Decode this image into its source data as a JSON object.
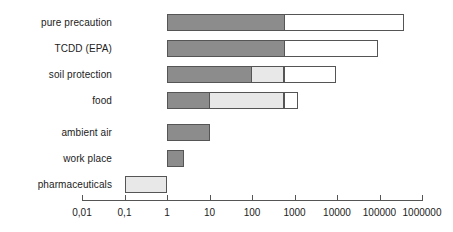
{
  "chart_data": {
    "type": "bar",
    "orientation": "horizontal",
    "title": "",
    "subtitle": "",
    "xlabel": "",
    "ylabel": "",
    "xscale": "log",
    "xlim": [
      0.01,
      1000000
    ],
    "grid": false,
    "legend": "none",
    "tick_labels": [
      "0,01",
      "0,1",
      "1",
      "10",
      "100",
      "1000",
      "10000",
      "100000",
      "1000000"
    ],
    "tick_values": [
      0.01,
      0.1,
      1,
      10,
      100,
      1000,
      10000,
      100000,
      1000000
    ],
    "categories": [
      "pure precaution",
      "TCDD (EPA)",
      "soil protection",
      "food",
      "ambient air",
      "work place",
      "pharmaceuticals"
    ],
    "series": [
      {
        "name": "dark-range",
        "color": "#8c8c8c"
      },
      {
        "name": "light-range",
        "color": "#e8e8e8"
      },
      {
        "name": "open-range",
        "color": "#ffffff"
      }
    ],
    "bars": [
      {
        "category": "pure precaution",
        "segments": [
          {
            "fill": "dark",
            "from": 1,
            "to": 600
          },
          {
            "fill": "open",
            "from": 600,
            "to": 400000
          }
        ],
        "range": [
          1,
          400000
        ]
      },
      {
        "category": "TCDD (EPA)",
        "segments": [
          {
            "fill": "dark",
            "from": 1,
            "to": 600
          },
          {
            "fill": "open",
            "from": 600,
            "to": 100000
          }
        ],
        "range": [
          1,
          100000
        ]
      },
      {
        "category": "soil protection",
        "segments": [
          {
            "fill": "dark",
            "from": 1,
            "to": 100
          },
          {
            "fill": "light",
            "from": 100,
            "to": 600
          },
          {
            "fill": "open",
            "from": 600,
            "to": 10000
          }
        ],
        "range": [
          1,
          10000
        ]
      },
      {
        "category": "food",
        "segments": [
          {
            "fill": "dark",
            "from": 1,
            "to": 10
          },
          {
            "fill": "light",
            "from": 10,
            "to": 600
          },
          {
            "fill": "open",
            "from": 600,
            "to": 1300
          }
        ],
        "range": [
          1,
          1300
        ]
      },
      {
        "category": "ambient air",
        "segments": [
          {
            "fill": "dark",
            "from": 1,
            "to": 10
          }
        ],
        "range": [
          1,
          10
        ]
      },
      {
        "category": "work place",
        "segments": [
          {
            "fill": "dark",
            "from": 1,
            "to": 2.5
          }
        ],
        "range": [
          1,
          2.5
        ]
      },
      {
        "category": "pharmaceuticals",
        "segments": [
          {
            "fill": "light",
            "from": 0.1,
            "to": 1
          }
        ],
        "range": [
          0.1,
          1
        ]
      }
    ],
    "colors": {
      "dark": "#8c8c8c",
      "light": "#e8e8e8",
      "open": "#ffffff",
      "outline": "#555555",
      "text": "#222222",
      "background": "#ffffff"
    },
    "layout": {
      "axis_y": 200,
      "axis_x_start": 82,
      "axis_x_end": 422,
      "px_per_decade": 42.5,
      "bar_height": 17,
      "row_tops": [
        14,
        40,
        66,
        92,
        124,
        150,
        176
      ]
    }
  }
}
